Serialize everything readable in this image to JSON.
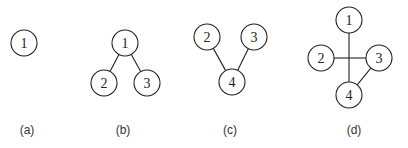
{
  "panels": [
    {
      "label": "(a)",
      "label_pos": [
        27,
        130
      ],
      "nodes": [
        {
          "id": "1",
          "x": 24,
          "y": 43
        }
      ],
      "edges": []
    },
    {
      "label": "(b)",
      "label_pos": [
        123,
        130
      ],
      "nodes": [
        {
          "id": "1",
          "x": 125,
          "y": 43
        },
        {
          "id": "2",
          "x": 104,
          "y": 83
        },
        {
          "id": "3",
          "x": 147,
          "y": 83
        }
      ],
      "edges": [
        [
          "1",
          "2"
        ],
        [
          "1",
          "3"
        ]
      ]
    },
    {
      "label": "(c)",
      "label_pos": [
        230,
        130
      ],
      "nodes": [
        {
          "id": "2",
          "x": 207,
          "y": 37
        },
        {
          "id": "3",
          "x": 254,
          "y": 37
        },
        {
          "id": "4",
          "x": 232,
          "y": 82
        }
      ],
      "edges": [
        [
          "2",
          "4"
        ],
        [
          "3",
          "4"
        ]
      ]
    },
    {
      "label": "(d)",
      "label_pos": [
        354,
        130
      ],
      "nodes": [
        {
          "id": "1",
          "x": 349,
          "y": 20
        },
        {
          "id": "2",
          "x": 321,
          "y": 58
        },
        {
          "id": "3",
          "x": 379,
          "y": 58
        },
        {
          "id": "4",
          "x": 349,
          "y": 95
        }
      ],
      "edges": [
        [
          "1",
          "4"
        ],
        [
          "2",
          "3"
        ],
        [
          "3",
          "4"
        ]
      ]
    }
  ],
  "style": {
    "node_radius": 13,
    "stroke": "#222222"
  }
}
